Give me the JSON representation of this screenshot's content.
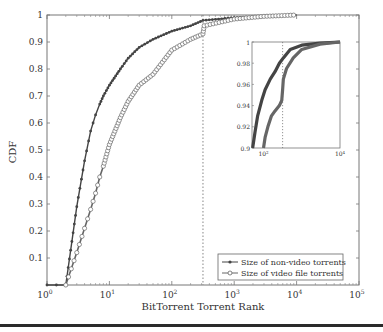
{
  "chart_data": {
    "type": "line",
    "title": "",
    "xlabel": "BitTorrent Torrent Rank",
    "ylabel": "CDF",
    "xscale": "log",
    "xlim": [
      1,
      100000
    ],
    "ylim": [
      0,
      1
    ],
    "x_ticks": [
      "10^0",
      "10^1",
      "10^2",
      "10^3",
      "10^4",
      "10^5"
    ],
    "y_ticks": [
      "0.1",
      "0.2",
      "0.3",
      "0.4",
      "0.5",
      "0.6",
      "0.7",
      "0.8",
      "0.9",
      "1"
    ],
    "grid": false,
    "legend_position": "lower right",
    "vertical_reference_line": {
      "x": 316,
      "style": "dotted"
    },
    "series": [
      {
        "name": "Size of non-video torrents",
        "marker": "dot",
        "x": [
          1,
          2,
          3,
          4,
          5,
          6,
          7,
          8,
          10,
          15,
          20,
          30,
          50,
          100,
          200,
          316,
          1000,
          3000,
          10000
        ],
        "y": [
          0,
          0,
          0.29,
          0.46,
          0.57,
          0.63,
          0.67,
          0.7,
          0.74,
          0.8,
          0.84,
          0.88,
          0.91,
          0.94,
          0.96,
          0.98,
          0.99,
          0.995,
          1.0
        ]
      },
      {
        "name": "Size of video file torrents",
        "marker": "circle",
        "x": [
          2,
          3,
          4,
          5,
          6,
          7,
          8,
          10,
          15,
          20,
          30,
          50,
          100,
          200,
          316,
          330,
          1000,
          3000,
          10000
        ],
        "y": [
          0,
          0.12,
          0.21,
          0.28,
          0.34,
          0.4,
          0.44,
          0.52,
          0.62,
          0.68,
          0.74,
          0.78,
          0.87,
          0.91,
          0.93,
          0.96,
          0.985,
          0.995,
          1.0
        ]
      }
    ],
    "inset": {
      "xscale": "log",
      "xlim": [
        50,
        10000
      ],
      "ylim": [
        0.9,
        1.0
      ],
      "x_ticks": [
        "10^2",
        "10^4"
      ],
      "y_ticks": [
        "0.9",
        "0.92",
        "0.94",
        "0.96",
        "0.98",
        "1"
      ],
      "vertical_reference_line": {
        "x": 316,
        "style": "dotted"
      }
    }
  },
  "labels": {
    "xlabel": "BitTorrent Torrent Rank",
    "ylabel": "CDF",
    "legend": [
      "Size of non-video torrents",
      "Size of video file torrents"
    ],
    "y_ticks": [
      "0.1",
      "0.2",
      "0.3",
      "0.4",
      "0.5",
      "0.6",
      "0.7",
      "0.8",
      "0.9",
      "1"
    ],
    "x_ticks_base": "10",
    "x_ticks_exp": [
      "0",
      "1",
      "2",
      "3",
      "4",
      "5"
    ],
    "inset_y_ticks": [
      "0.9",
      "0.92",
      "0.94",
      "0.96",
      "0.98",
      "1"
    ],
    "inset_x_ticks_exp": [
      "2",
      "4"
    ]
  },
  "colors": {
    "line_nonvideo": "#444444",
    "line_video": "#666666",
    "axis": "#555555",
    "rule": "#2a2a2a"
  }
}
